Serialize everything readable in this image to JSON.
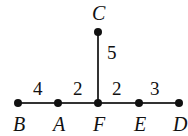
{
  "diagram": {
    "nodes": [
      {
        "id": "B",
        "label": "B",
        "x": 18,
        "y": 103
      },
      {
        "id": "A",
        "label": "A",
        "x": 58,
        "y": 103
      },
      {
        "id": "F",
        "label": "F",
        "x": 98,
        "y": 103
      },
      {
        "id": "E",
        "label": "E",
        "x": 139,
        "y": 103
      },
      {
        "id": "D",
        "label": "D",
        "x": 179,
        "y": 103
      },
      {
        "id": "C",
        "label": "C",
        "x": 98,
        "y": 32
      }
    ],
    "edges": [
      {
        "from": "B",
        "to": "A",
        "weight": "4"
      },
      {
        "from": "A",
        "to": "F",
        "weight": "2"
      },
      {
        "from": "F",
        "to": "E",
        "weight": "2"
      },
      {
        "from": "E",
        "to": "D",
        "weight": "3"
      },
      {
        "from": "F",
        "to": "C",
        "weight": "5"
      }
    ],
    "colors": {
      "line": "#333333",
      "node": "#111111",
      "text": "#111111"
    }
  }
}
